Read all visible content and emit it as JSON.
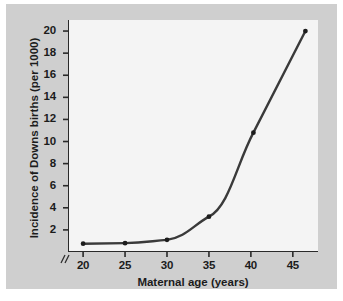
{
  "figure": {
    "background_color": "#cfcfcf",
    "plot_background_color": "#f4f4f4",
    "axis_color": "#2a2a2a",
    "line_color": "#3a3a3a"
  },
  "chart_data": {
    "type": "line",
    "title": "",
    "subtitle": "",
    "xlabel": "Maternal age (years)",
    "ylabel": "Incidence of Downs births (per 1000)",
    "x": [
      20,
      25,
      30,
      35,
      40.3,
      46.5
    ],
    "values": [
      0.75,
      0.8,
      1.1,
      3.2,
      10.8,
      20.0
    ],
    "series": [
      {
        "name": "Incidence of Downs births",
        "values": [
          0.75,
          0.8,
          1.1,
          3.2,
          10.8,
          20.0
        ]
      }
    ],
    "xticks": [
      20,
      25,
      30,
      35,
      40,
      45
    ],
    "xtick_labels": [
      "20",
      "25",
      "30",
      "35",
      "40",
      "45"
    ],
    "yticks": [
      2,
      4,
      6,
      8,
      10,
      12,
      14,
      16,
      18,
      20
    ],
    "ytick_labels": [
      "2",
      "4",
      "6",
      "8",
      "10",
      "12",
      "14",
      "16",
      "18",
      "20"
    ],
    "xlim": [
      18.2,
      48.0
    ],
    "ylim": [
      0,
      21.0
    ],
    "grid": false,
    "legend": null,
    "legend_position": "none",
    "marker": "filled-circle",
    "axis_break": "//",
    "axis_break_axis": "x",
    "annotations": []
  }
}
